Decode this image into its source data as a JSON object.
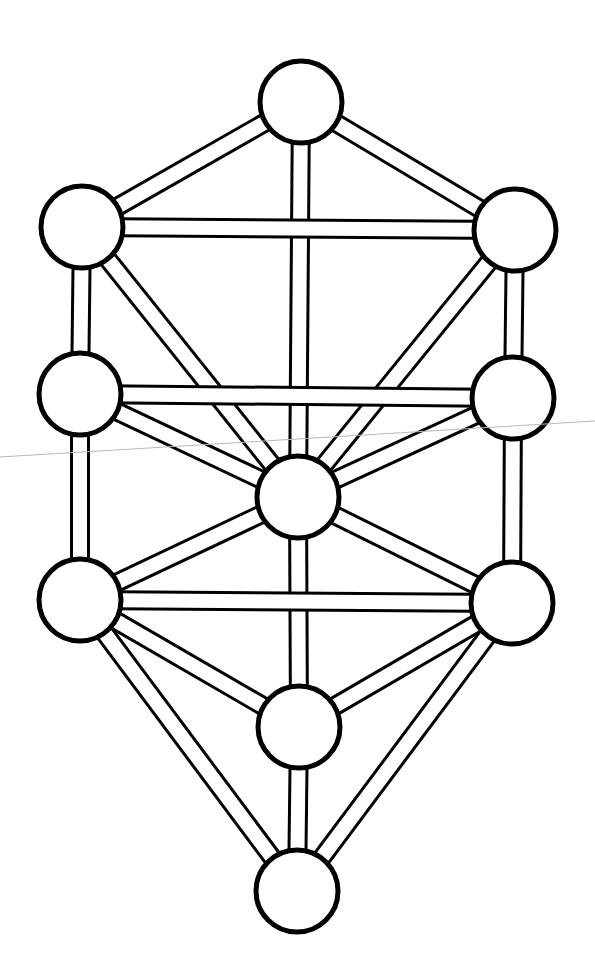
{
  "diagram": {
    "colors": {
      "stroke": "#000000",
      "fill": "#ffffff",
      "background": "#ffffff",
      "scan_line": "#b8b8b8"
    },
    "nodes": [
      {
        "id": "n1",
        "name": "top"
      },
      {
        "id": "n2",
        "name": "upper-right"
      },
      {
        "id": "n3",
        "name": "upper-left"
      },
      {
        "id": "n4",
        "name": "middle-right"
      },
      {
        "id": "n5",
        "name": "middle-left"
      },
      {
        "id": "n6",
        "name": "center"
      },
      {
        "id": "n7",
        "name": "lower-right"
      },
      {
        "id": "n8",
        "name": "lower-left"
      },
      {
        "id": "n9",
        "name": "lower-center"
      },
      {
        "id": "n10",
        "name": "bottom"
      }
    ],
    "paths": [
      [
        "n1",
        "n3"
      ],
      [
        "n1",
        "n2"
      ],
      [
        "n1",
        "n6"
      ],
      [
        "n3",
        "n2"
      ],
      [
        "n3",
        "n5"
      ],
      [
        "n2",
        "n4"
      ],
      [
        "n3",
        "n6"
      ],
      [
        "n2",
        "n6"
      ],
      [
        "n5",
        "n4"
      ],
      [
        "n5",
        "n6"
      ],
      [
        "n4",
        "n6"
      ],
      [
        "n5",
        "n8"
      ],
      [
        "n4",
        "n7"
      ],
      [
        "n6",
        "n8"
      ],
      [
        "n6",
        "n7"
      ],
      [
        "n6",
        "n9"
      ],
      [
        "n8",
        "n7"
      ],
      [
        "n8",
        "n9"
      ],
      [
        "n7",
        "n9"
      ],
      [
        "n8",
        "n10"
      ],
      [
        "n7",
        "n10"
      ],
      [
        "n9",
        "n10"
      ]
    ]
  }
}
